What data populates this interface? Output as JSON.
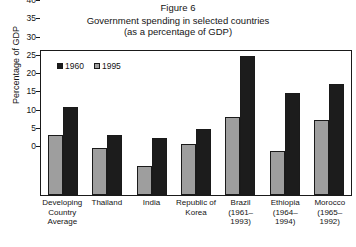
{
  "figure": {
    "number": "Figure 6",
    "title_line1": "Government spending in selected countries",
    "title_line2": "(as a percentage of GDP)"
  },
  "colors": {
    "series_1960": "#1c1c1c",
    "series_1995": "#9e9e9e",
    "axis": "#1a1a1a",
    "text": "#141414",
    "background": "#ffffff"
  },
  "legend": {
    "position": "top-left-inside",
    "entries": [
      {
        "label": "1960",
        "swatch": "#1c1c1c"
      },
      {
        "label": "1995",
        "swatch": "#9e9e9e"
      }
    ]
  },
  "axes": {
    "ylabel": "Percentage of GDP",
    "yticks": [
      "40",
      "35",
      "30",
      "25",
      "20",
      "15",
      "10",
      "5",
      "0"
    ],
    "ylim": [
      0,
      40
    ],
    "grid": false
  },
  "chart_data": {
    "type": "bar",
    "title": "Government spending in selected countries (as a percentage of GDP)",
    "xlabel": "",
    "ylabel": "Percentage of GDP",
    "ylim": [
      0,
      40
    ],
    "grid": false,
    "legend_position": "top-left-inside",
    "categories": [
      "Developing Country Average",
      "Thailand",
      "India",
      "Republic of Korea",
      "Brazil (1961–1993)",
      "Ethiopia (1964–1994)",
      "Morocco (1965–1992)"
    ],
    "category_lines": [
      [
        "Developing",
        "Country",
        "Average"
      ],
      [
        "Thailand"
      ],
      [
        "India"
      ],
      [
        "Republic of",
        "Korea"
      ],
      [
        "Brazil",
        "(1961–1993)"
      ],
      [
        "Ethiopia",
        "(1964–",
        "1994)"
      ],
      [
        "Morocco",
        "(1965–1992)"
      ]
    ],
    "series": [
      {
        "name": "1995",
        "color": "#9e9e9e",
        "values": [
          16.5,
          13.0,
          8.0,
          14.0,
          21.5,
          12.0,
          20.5
        ]
      },
      {
        "name": "1960",
        "color": "#1c1c1c",
        "values": [
          24.0,
          16.5,
          15.5,
          18.0,
          38.0,
          28.0,
          30.5
        ]
      }
    ],
    "bar_order_left_to_right": [
      "1995",
      "1960"
    ]
  }
}
